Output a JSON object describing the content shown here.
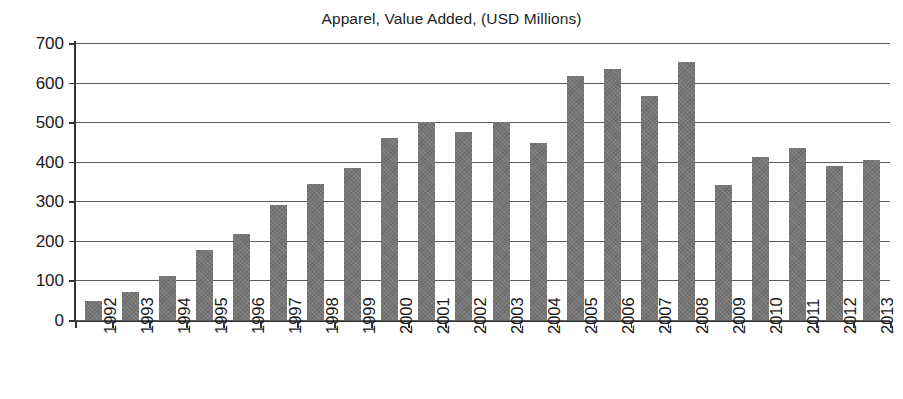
{
  "chart_data": {
    "type": "bar",
    "title": "Apparel, Value Added, (USD Millions)",
    "xlabel": "",
    "ylabel": "",
    "ylim": [
      0,
      700
    ],
    "y_ticks": [
      0,
      100,
      200,
      300,
      400,
      500,
      600,
      700
    ],
    "y_tick_labels": [
      "0",
      "100",
      "200",
      "300",
      "400",
      "500",
      "600",
      "700"
    ],
    "grid": true,
    "grid_axis": "y",
    "legend": false,
    "bar_color": "#767676",
    "categories": [
      "1992",
      "1993",
      "1994",
      "1995",
      "1996",
      "1997",
      "1998",
      "1999",
      "2000",
      "2001",
      "2002",
      "2003",
      "2004",
      "2005",
      "2006",
      "2007",
      "2008",
      "2009",
      "2010",
      "2011",
      "2012",
      "2013"
    ],
    "values": [
      48,
      70,
      110,
      177,
      218,
      290,
      343,
      383,
      461,
      500,
      476,
      500,
      448,
      617,
      635,
      567,
      653,
      340,
      413,
      435,
      388,
      405
    ],
    "series": [
      {
        "name": "Apparel, Value Added",
        "values": [
          48,
          70,
          110,
          177,
          218,
          290,
          343,
          383,
          461,
          500,
          476,
          500,
          448,
          617,
          635,
          567,
          653,
          340,
          413,
          435,
          388,
          405
        ]
      }
    ]
  }
}
